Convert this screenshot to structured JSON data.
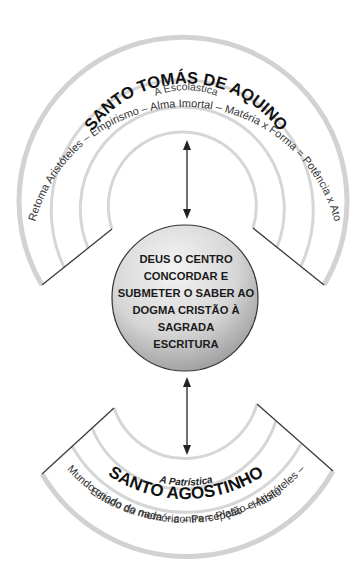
{
  "top_section": {
    "outer_label": "Retoma Aristóteles – Empirismo – Alma Imortal – Matéria x Forma = Potência x Ato",
    "title": "SANTO TOMÁS DE AQUINO",
    "subtitle": "A Escolástica"
  },
  "center_circle": {
    "lines": [
      "DEUS O CENTRO",
      "CONCORDAR E",
      "SUBMETER O SABER AO",
      "DOGMA CRISTÃO À",
      "SAGRADA",
      "ESCRITURA"
    ]
  },
  "bottom_section": {
    "subtitle": "A Patrística",
    "title": "SANTO AGOSTINHO",
    "outer_label_line1": "Mundo criado do nada – contra = Platão e Aristóteles –",
    "outer_label_line2": "Estudo da memória – Percepção – Hábito"
  },
  "colors": {
    "arc_stroke": "#d2d2d2",
    "edge_line": "#3a3a3a",
    "circle_light": "#f2f2f2",
    "circle_dark": "#9a9a9a"
  }
}
